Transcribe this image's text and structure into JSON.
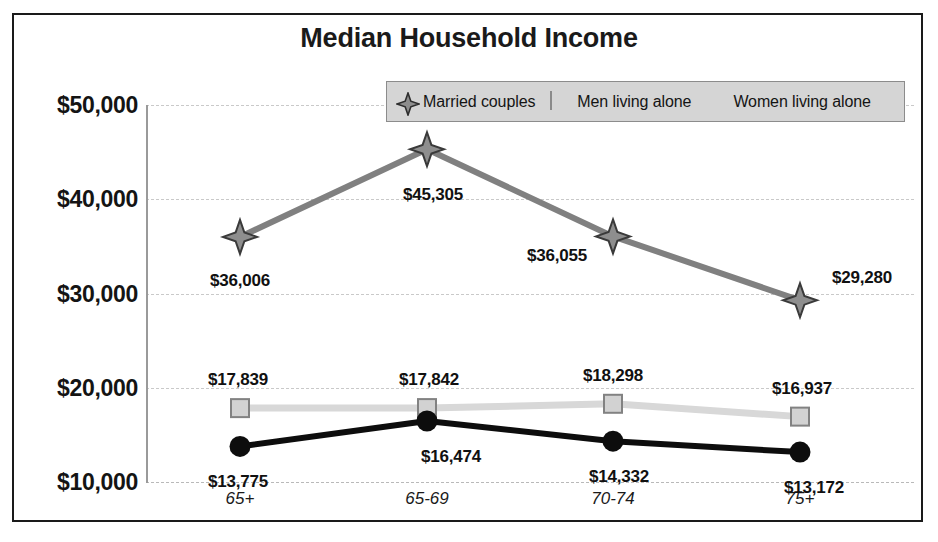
{
  "chart_data": {
    "type": "line",
    "title": "Median Household Income",
    "xlabel": "",
    "ylabel": "",
    "categories": [
      "65+",
      "65-69",
      "70-74",
      "75+"
    ],
    "ylim": [
      10000,
      50000
    ],
    "ytick_values": [
      50000,
      40000,
      30000,
      20000,
      10000
    ],
    "ytick_labels": [
      "$50,000",
      "$40,000",
      "$30,000",
      "$20,000",
      "$10,000"
    ],
    "grid": true,
    "legend_position": "top-right",
    "series": [
      {
        "name": "Married couples",
        "marker": "diamond-star",
        "color": "#808080",
        "values": [
          36006,
          45305,
          36055,
          29280
        ],
        "labels": [
          "$36,006",
          "$45,305",
          "$36,055",
          "$29,280"
        ]
      },
      {
        "name": "Men living alone",
        "marker": "square",
        "color": "#d8d8d8",
        "values": [
          17839,
          17842,
          18298,
          16937
        ],
        "labels": [
          "$17,839",
          "$17,842",
          "$18,298",
          "$16,937"
        ]
      },
      {
        "name": "Women living alone",
        "marker": "circle",
        "color": "#0d0d0d",
        "values": [
          13775,
          16474,
          14332,
          13172
        ],
        "labels": [
          "$13,775",
          "$16,474",
          "$14,332",
          "$13,172"
        ]
      }
    ]
  },
  "legend": {
    "items": [
      {
        "label": "Married couples",
        "icon": "diamond-star-marker-icon"
      },
      {
        "label": "Men living alone",
        "icon": "square-marker-icon"
      },
      {
        "label": "Women living alone",
        "icon": "circle-marker-icon"
      }
    ]
  },
  "colors": {
    "frame": "#1a1a1a",
    "grid": "#c9c9c9",
    "axis": "#9a9a9a",
    "legend_background": "#d5d5d5",
    "legend_border": "#8c8c8c",
    "text": "#141414"
  }
}
